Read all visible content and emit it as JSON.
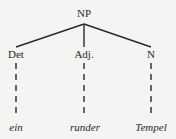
{
  "tree": {
    "root": {
      "label": "NP"
    },
    "children": [
      {
        "label": "Det",
        "word": "ein"
      },
      {
        "label": "Adj.",
        "word": "runder"
      },
      {
        "label": "N",
        "word": "Tempel"
      }
    ]
  },
  "colors": {
    "line": "#2a2a2a",
    "background": "#f4f4f2"
  }
}
